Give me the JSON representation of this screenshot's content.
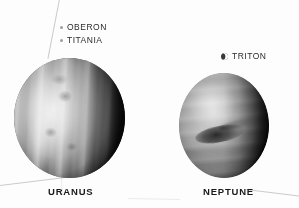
{
  "figure": {
    "background_color": "#fdfdfd",
    "width": 299,
    "height": 208
  },
  "planets": [
    {
      "id": "uranus",
      "name": "URANUS",
      "appearance": "grayscale disc with vertical cloud banding, bright left-of-center zone, dark right limb",
      "moons": [
        {
          "id": "oberon",
          "name": "OBERON",
          "marker": "moon-dot"
        },
        {
          "id": "titania",
          "name": "TITANIA",
          "marker": "moon-dot"
        }
      ]
    },
    {
      "id": "neptune",
      "name": "NEPTUNE",
      "appearance": "grayscale disc with Great Dark Spot, faint horizontal bands, dark right limb",
      "moons": [
        {
          "id": "triton",
          "name": "TRITON",
          "marker": "moon-crescent"
        }
      ]
    }
  ],
  "icons": {
    "moon_dot": "moon-dot-icon",
    "moon_crescent": "crescent-moon-icon"
  },
  "decorations": {
    "scanlines": [
      "top-diagonal-streak",
      "bottom-left-diagonal",
      "bottom-right-diagonal",
      "bottom-center-hairline",
      "uranus-stem-hairline"
    ]
  },
  "colors": {
    "label_text": "#1a1a1a",
    "moon_label_text": "#2b2b2b",
    "scanline": "#b9b9b9",
    "background": "#fdfdfd"
  }
}
